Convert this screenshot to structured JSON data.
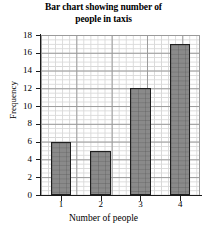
{
  "chart_data": {
    "type": "bar",
    "title": "Bar chart showing number of people in taxis",
    "title_line1": "Bar chart showing number of",
    "title_line2": "people in taxis",
    "xlabel": "Number of people",
    "ylabel": "Frequency",
    "categories": [
      "1",
      "2",
      "3",
      "4"
    ],
    "values": [
      6,
      5,
      12,
      17
    ],
    "ylim": [
      0,
      18
    ],
    "ytick_step": 2,
    "yticks": [
      "18",
      "16",
      "14",
      "12",
      "10",
      "8",
      "6",
      "4",
      "2",
      "0"
    ],
    "grid": true,
    "grid_minor_step": 0.5,
    "legend": null,
    "bar_color": "#8a8a8a",
    "bar_edge_color": "#1f1f1f",
    "grid_color": "#d8d8d8",
    "grid_major_color": "#9a9a9a",
    "axis_color": "#1a1a1a"
  }
}
